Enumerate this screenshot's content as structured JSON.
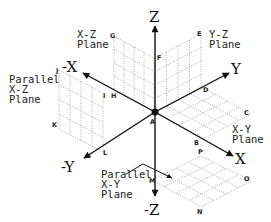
{
  "diagram": {
    "axes": {
      "z_pos": "Z",
      "z_neg": "-Z",
      "x_pos": "X",
      "x_neg": "-X",
      "y_pos": "Y",
      "y_neg": "-Y"
    },
    "origin_label": "A",
    "planes": {
      "xz": {
        "line1": "X-Z",
        "line2": "Plane"
      },
      "yz": {
        "line1": "Y-Z",
        "line2": "Plane"
      },
      "xy": {
        "line1": "X-Y",
        "line2": "Plane"
      },
      "parallel_xz": {
        "line1": "Parallel",
        "line2": "X-Z",
        "line3": "Plane"
      },
      "parallel_xy": {
        "line1": "Parallel",
        "line2": "X-Y",
        "line3": "Plane"
      }
    },
    "points": {
      "A": "A",
      "B": "B",
      "C": "C",
      "D": "D",
      "E": "E",
      "F": "F",
      "G": "G",
      "H": "H",
      "I": "I",
      "J": "J",
      "K": "K",
      "L": "L",
      "M": "M",
      "N": "N",
      "O": "O",
      "P": "P"
    },
    "colors": {
      "axis": "#111111",
      "grid": "#9a9a9a",
      "background": "#ffffff"
    }
  }
}
